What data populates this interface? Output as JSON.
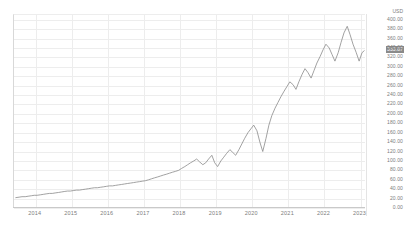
{
  "chart_data": {
    "type": "line",
    "title": "",
    "subtitle": "",
    "xlabel": "",
    "ylabel": "USD",
    "unit_label": "USD",
    "grid": true,
    "legend": null,
    "ylim": [
      0,
      410
    ],
    "ytick_labels": [
      "400.00",
      "380.00",
      "360.00",
      "340.00",
      "320.00",
      "300.00",
      "280.00",
      "260.00",
      "240.00",
      "220.00",
      "200.00",
      "180.00",
      "160.00",
      "140.00",
      "120.00",
      "100.00",
      "80.00",
      "60.00",
      "40.00",
      "20.00",
      "0.00"
    ],
    "ytick_values": [
      400,
      380,
      360,
      340,
      320,
      300,
      280,
      260,
      240,
      220,
      200,
      180,
      160,
      140,
      120,
      100,
      80,
      60,
      40,
      20,
      0
    ],
    "xtick_labels": [
      "2014",
      "2015",
      "2016",
      "2017",
      "2018",
      "2019",
      "2020",
      "2021",
      "2022",
      "2023"
    ],
    "xlim": [
      2013.4,
      2023.15
    ],
    "current_value_label": "333.87",
    "current_value": 333.87,
    "line_color": "#8a8a8a",
    "grid_color": "#ededed",
    "axis_text_color": "#7c7c7c",
    "highlight_bg_color": "#8a8a8a",
    "highlight_text_color": "#ffffff",
    "x": [
      2013.45,
      2013.54,
      2013.62,
      2013.71,
      2013.79,
      2013.88,
      2013.96,
      2014.04,
      2014.13,
      2014.21,
      2014.29,
      2014.38,
      2014.46,
      2014.54,
      2014.63,
      2014.71,
      2014.79,
      2014.88,
      2014.96,
      2015.04,
      2015.13,
      2015.21,
      2015.29,
      2015.38,
      2015.46,
      2015.54,
      2015.63,
      2015.71,
      2015.79,
      2015.88,
      2015.96,
      2016.04,
      2016.13,
      2016.21,
      2016.29,
      2016.38,
      2016.46,
      2016.54,
      2016.63,
      2016.71,
      2016.79,
      2016.88,
      2016.96,
      2017.04,
      2017.13,
      2017.21,
      2017.29,
      2017.38,
      2017.46,
      2017.54,
      2017.63,
      2017.71,
      2017.79,
      2017.88,
      2017.96,
      2018.04,
      2018.13,
      2018.21,
      2018.29,
      2018.38,
      2018.46,
      2018.54,
      2018.63,
      2018.71,
      2018.79,
      2018.88,
      2018.96,
      2019.04,
      2019.13,
      2019.21,
      2019.29,
      2019.38,
      2019.46,
      2019.54,
      2019.63,
      2019.71,
      2019.79,
      2019.88,
      2019.96,
      2020.04,
      2020.13,
      2020.21,
      2020.29,
      2020.38,
      2020.46,
      2020.54,
      2020.63,
      2020.71,
      2020.79,
      2020.88,
      2020.96,
      2021.04,
      2021.13,
      2021.21,
      2021.29,
      2021.38,
      2021.46,
      2021.54,
      2021.63,
      2021.71,
      2021.79,
      2021.88,
      2021.96,
      2022.04,
      2022.13,
      2022.21,
      2022.29,
      2022.38,
      2022.46,
      2022.54,
      2022.63,
      2022.71,
      2022.79,
      2022.88,
      2022.96,
      2023.04,
      2023.1
    ],
    "y": [
      22,
      23,
      24,
      24,
      25,
      26,
      27,
      27,
      28,
      29,
      30,
      31,
      31,
      32,
      33,
      34,
      35,
      36,
      36,
      37,
      38,
      38,
      39,
      40,
      41,
      42,
      43,
      43,
      44,
      45,
      46,
      47,
      47,
      48,
      49,
      50,
      51,
      52,
      53,
      54,
      55,
      56,
      57,
      58,
      60,
      62,
      64,
      66,
      68,
      70,
      72,
      74,
      76,
      78,
      80,
      84,
      88,
      92,
      96,
      100,
      104,
      98,
      92,
      96,
      104,
      112,
      96,
      88,
      100,
      108,
      116,
      124,
      118,
      112,
      124,
      136,
      148,
      160,
      168,
      176,
      164,
      140,
      120,
      148,
      176,
      196,
      212,
      224,
      236,
      248,
      258,
      268,
      262,
      252,
      268,
      284,
      296,
      288,
      276,
      292,
      308,
      322,
      336,
      348,
      340,
      326,
      312,
      330,
      352,
      372,
      386,
      368,
      348,
      330,
      312,
      330,
      334
    ],
    "series": [
      {
        "name": "price",
        "values_note": "monthly closing price in USD"
      }
    ]
  }
}
